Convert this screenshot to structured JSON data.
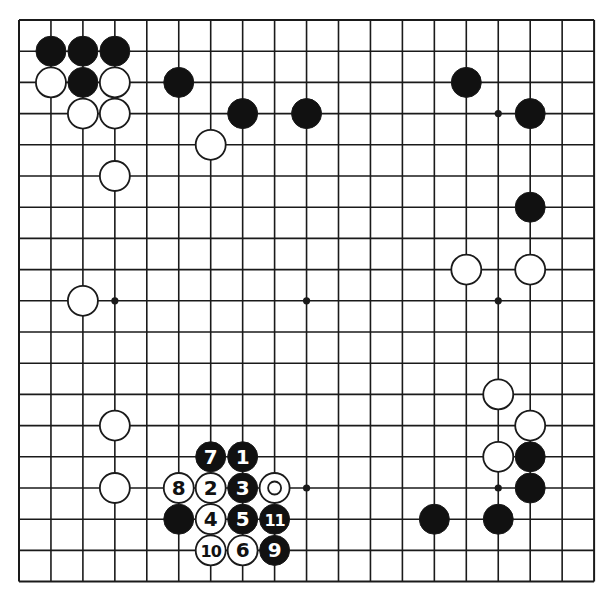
{
  "diagram": {
    "type": "go-board",
    "size": 19,
    "geometry": {
      "left": 19,
      "top": 20,
      "dx": 31.95,
      "dy": 31.2,
      "stone_radius": 15
    },
    "colors": {
      "line": "#1a1a1a",
      "black_stone": "#111111",
      "white_stone": "#ffffff",
      "black_label": "#ffffff",
      "white_label": "#111111",
      "background": "#ffffff"
    },
    "hoshi": [
      {
        "c": 3,
        "r": 3
      },
      {
        "c": 9,
        "r": 3
      },
      {
        "c": 15,
        "r": 3
      },
      {
        "c": 3,
        "r": 9
      },
      {
        "c": 9,
        "r": 9
      },
      {
        "c": 15,
        "r": 9
      },
      {
        "c": 3,
        "r": 15
      },
      {
        "c": 9,
        "r": 15
      },
      {
        "c": 15,
        "r": 15
      }
    ],
    "stones": [
      {
        "color": "black",
        "c": 1,
        "r": 1,
        "label": ""
      },
      {
        "color": "black",
        "c": 2,
        "r": 1,
        "label": ""
      },
      {
        "color": "black",
        "c": 3,
        "r": 1,
        "label": ""
      },
      {
        "color": "white",
        "c": 1,
        "r": 2,
        "label": ""
      },
      {
        "color": "black",
        "c": 2,
        "r": 2,
        "label": ""
      },
      {
        "color": "white",
        "c": 3,
        "r": 2,
        "label": ""
      },
      {
        "color": "black",
        "c": 5,
        "r": 2,
        "label": ""
      },
      {
        "color": "white",
        "c": 2,
        "r": 3,
        "label": ""
      },
      {
        "color": "white",
        "c": 3,
        "r": 3,
        "label": ""
      },
      {
        "color": "black",
        "c": 7,
        "r": 3,
        "label": ""
      },
      {
        "color": "black",
        "c": 9,
        "r": 3,
        "label": ""
      },
      {
        "color": "white",
        "c": 6,
        "r": 4,
        "label": ""
      },
      {
        "color": "white",
        "c": 3,
        "r": 5,
        "label": ""
      },
      {
        "color": "black",
        "c": 14,
        "r": 2,
        "label": ""
      },
      {
        "color": "black",
        "c": 16,
        "r": 3,
        "label": ""
      },
      {
        "color": "black",
        "c": 16,
        "r": 6,
        "label": ""
      },
      {
        "color": "white",
        "c": 14,
        "r": 8,
        "label": ""
      },
      {
        "color": "white",
        "c": 16,
        "r": 8,
        "label": ""
      },
      {
        "color": "white",
        "c": 2,
        "r": 9,
        "label": ""
      },
      {
        "color": "white",
        "c": 3,
        "r": 13,
        "label": ""
      },
      {
        "color": "white",
        "c": 3,
        "r": 15,
        "label": ""
      },
      {
        "color": "white",
        "c": 15,
        "r": 12,
        "label": ""
      },
      {
        "color": "white",
        "c": 16,
        "r": 13,
        "label": ""
      },
      {
        "color": "white",
        "c": 15,
        "r": 14,
        "label": ""
      },
      {
        "color": "black",
        "c": 16,
        "r": 14,
        "label": ""
      },
      {
        "color": "black",
        "c": 16,
        "r": 15,
        "label": ""
      },
      {
        "color": "black",
        "c": 13,
        "r": 16,
        "label": ""
      },
      {
        "color": "black",
        "c": 15,
        "r": 16,
        "label": ""
      },
      {
        "color": "black",
        "c": 7,
        "r": 14,
        "label": "1"
      },
      {
        "color": "white",
        "c": 6,
        "r": 15,
        "label": "2"
      },
      {
        "color": "black",
        "c": 7,
        "r": 15,
        "label": "3"
      },
      {
        "color": "white",
        "c": 6,
        "r": 16,
        "label": "4"
      },
      {
        "color": "black",
        "c": 7,
        "r": 16,
        "label": "5"
      },
      {
        "color": "white",
        "c": 7,
        "r": 17,
        "label": "6"
      },
      {
        "color": "black",
        "c": 6,
        "r": 14,
        "label": "7"
      },
      {
        "color": "white",
        "c": 5,
        "r": 15,
        "label": "8"
      },
      {
        "color": "black",
        "c": 8,
        "r": 17,
        "label": "9"
      },
      {
        "color": "white",
        "c": 6,
        "r": 17,
        "label": "10"
      },
      {
        "color": "black",
        "c": 8,
        "r": 16,
        "label": "11"
      },
      {
        "color": "white",
        "c": 8,
        "r": 15,
        "label": "",
        "marker": "circle"
      },
      {
        "color": "black",
        "c": 5,
        "r": 16,
        "label": ""
      }
    ]
  }
}
